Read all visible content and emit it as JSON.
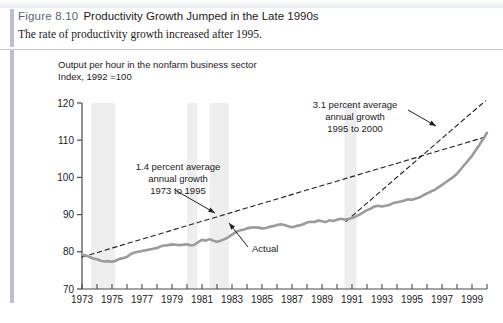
{
  "figure": {
    "number": "Figure 8.10",
    "title": "Productivity Growth Jumped in the Late 1990s",
    "subtitle": "The rate of productivity growth increased after 1995."
  },
  "footer": {
    "note": ""
  },
  "chart_data": {
    "type": "line",
    "title": "Productivity Growth Jumped in the Late 1990s",
    "subtitle": "The rate of productivity growth increased after 1995.",
    "header_line_1": "Output per hour in the nonfarm business sector",
    "header_line_2": "Index, 1992 =100",
    "xlabel": "",
    "ylabel": "Index, 1992 =100",
    "xlim": [
      1973,
      2000
    ],
    "ylim": [
      70,
      120
    ],
    "yticks": [
      70,
      80,
      90,
      100,
      110,
      120
    ],
    "xticks": [
      1973,
      1975,
      1977,
      1979,
      1981,
      1983,
      1985,
      1987,
      1989,
      1991,
      1993,
      1995,
      1997,
      1999
    ],
    "xtick_labels": [
      "1973",
      "1975",
      "1977",
      "1979",
      "1981",
      "1983",
      "1985",
      "1987",
      "1989",
      "1991",
      "1993",
      "1995",
      "1997",
      "1999"
    ],
    "ytick_labels": [
      "70",
      "80",
      "90",
      "100",
      "110",
      "120"
    ],
    "grid": false,
    "legend": "none",
    "series": [
      {
        "name": "Actual",
        "style": "solid",
        "color": "#9b9b9b",
        "x": [
          1973.0,
          1973.25,
          1973.5,
          1973.75,
          1974.0,
          1974.25,
          1974.5,
          1974.75,
          1975.0,
          1975.25,
          1975.5,
          1975.75,
          1976.0,
          1976.25,
          1976.5,
          1976.75,
          1977.0,
          1977.25,
          1977.5,
          1977.75,
          1978.0,
          1978.25,
          1978.5,
          1978.75,
          1979.0,
          1979.25,
          1979.5,
          1979.75,
          1980.0,
          1980.25,
          1980.5,
          1980.75,
          1981.0,
          1981.25,
          1981.5,
          1981.75,
          1982.0,
          1982.25,
          1982.5,
          1982.75,
          1983.0,
          1983.25,
          1983.5,
          1983.75,
          1984.0,
          1984.25,
          1984.5,
          1984.75,
          1985.0,
          1985.25,
          1985.5,
          1985.75,
          1986.0,
          1986.25,
          1986.5,
          1986.75,
          1987.0,
          1987.25,
          1987.5,
          1987.75,
          1988.0,
          1988.25,
          1988.5,
          1988.75,
          1989.0,
          1989.25,
          1989.5,
          1989.75,
          1990.0,
          1990.25,
          1990.5,
          1990.75,
          1991.0,
          1991.25,
          1991.5,
          1991.75,
          1992.0,
          1992.25,
          1992.5,
          1992.75,
          1993.0,
          1993.25,
          1993.5,
          1993.75,
          1994.0,
          1994.25,
          1994.5,
          1994.75,
          1995.0,
          1995.25,
          1995.5,
          1995.75,
          1996.0,
          1996.25,
          1996.5,
          1996.75,
          1997.0,
          1997.25,
          1997.5,
          1997.75,
          1998.0,
          1998.25,
          1998.5,
          1998.75,
          1999.0,
          1999.25,
          1999.5,
          1999.75,
          2000.0
        ],
        "y": [
          79.2,
          79.0,
          78.6,
          78.2,
          78.0,
          77.6,
          77.4,
          77.5,
          77.3,
          77.6,
          78.1,
          78.3,
          78.6,
          79.4,
          79.8,
          80.0,
          80.2,
          80.4,
          80.6,
          80.8,
          81.0,
          81.5,
          81.7,
          81.8,
          82.0,
          81.9,
          81.8,
          81.9,
          82.0,
          81.7,
          81.9,
          82.6,
          83.2,
          83.0,
          83.4,
          83.0,
          82.7,
          83.0,
          83.4,
          83.9,
          84.6,
          85.3,
          85.7,
          85.9,
          86.3,
          86.5,
          86.6,
          86.5,
          86.3,
          86.4,
          86.7,
          86.9,
          87.2,
          87.4,
          87.2,
          86.9,
          86.6,
          86.9,
          87.1,
          87.4,
          87.9,
          88.1,
          88.0,
          88.4,
          88.2,
          88.0,
          88.5,
          88.3,
          88.6,
          88.9,
          88.7,
          88.8,
          89.1,
          89.5,
          90.0,
          90.6,
          91.2,
          91.6,
          92.2,
          92.4,
          92.2,
          92.4,
          92.6,
          93.1,
          93.3,
          93.5,
          93.8,
          94.1,
          94.0,
          94.3,
          94.6,
          95.2,
          95.7,
          96.2,
          96.6,
          97.3,
          98.0,
          98.7,
          99.4,
          100.1,
          101.0,
          102.2,
          103.4,
          104.6,
          105.8,
          107.3,
          108.8,
          110.4,
          112.0
        ]
      },
      {
        "name": "1.4 percent average annual growth trend 1973 to 1995",
        "style": "dashed",
        "color": "#1d2024",
        "x": [
          1973.0,
          2000.0
        ],
        "y": [
          78.6,
          111.0
        ],
        "growth_rate_percent": 1.4,
        "period": "1973 to 1995"
      },
      {
        "name": "3.1 percent average annual growth trend 1995 to 2000",
        "style": "dashed",
        "color": "#1d2024",
        "x": [
          1990.6,
          1999.9
        ],
        "y": [
          88.2,
          120.6
        ],
        "growth_rate_percent": 3.1,
        "period": "1995 to 2000"
      }
    ],
    "shaded_bands": [
      {
        "name": "recession-1973-1975",
        "x0": 1973.6,
        "x1": 1975.2
      },
      {
        "name": "recession-1980",
        "x0": 1980.0,
        "x1": 1980.7
      },
      {
        "name": "recession-1981-1982",
        "x0": 1981.5,
        "x1": 1982.8
      },
      {
        "name": "recession-1990-1991",
        "x0": 1990.5,
        "x1": 1991.3
      }
    ],
    "annotations": [
      {
        "name": "trend-1973-1995-annotation",
        "lines": [
          "1.4 percent average",
          "annual growth",
          "1973 to 1995"
        ],
        "text_x": 178,
        "text_y": 120,
        "arrow_from": [
          175,
          140
        ],
        "arrow_to": [
          215,
          163
        ]
      },
      {
        "name": "trend-1995-2000-annotation",
        "lines": [
          "3.1 percent average",
          "annual growth",
          "1995 to 2000"
        ],
        "text_x": 355,
        "text_y": 58,
        "arrow_from": [
          408,
          60
        ],
        "arrow_to": [
          436,
          76
        ]
      },
      {
        "name": "actual-series-annotation",
        "lines": [
          "Actual"
        ],
        "text_x": 252,
        "text_y": 202,
        "arrow_from": [
          248,
          197
        ],
        "arrow_to": [
          229,
          173
        ]
      }
    ]
  }
}
